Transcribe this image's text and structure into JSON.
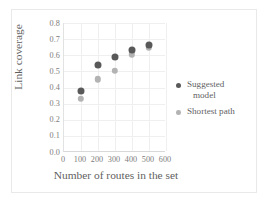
{
  "chart_data": {
    "type": "scatter",
    "title": "",
    "xlabel": "Number of routes in the set",
    "ylabel": "Link coverage",
    "xlim": [
      0,
      600
    ],
    "ylim": [
      0.0,
      0.8
    ],
    "grid": true,
    "legend_position": "right",
    "xticks": [
      "0",
      "100",
      "200",
      "300",
      "400",
      "500",
      "600"
    ],
    "yticks": [
      "0.0",
      "0.1",
      "0.2",
      "0.3",
      "0.4",
      "0.5",
      "0.6",
      "0.7",
      "0.8"
    ],
    "x": [
      100,
      200,
      300,
      400,
      500
    ],
    "series": [
      {
        "name": "Suggested model",
        "color": "#595959",
        "values": [
          0.38,
          0.54,
          0.59,
          0.63,
          0.665
        ]
      },
      {
        "name": "Shortest path",
        "color": "#b3b3b3",
        "values": [
          0.33,
          0.45,
          0.505,
          0.605,
          0.645
        ]
      }
    ]
  },
  "legend": {
    "entries": [
      {
        "label_line1": "Suggested",
        "label_line2": "model"
      },
      {
        "label_line1": "Shortest path",
        "label_line2": ""
      }
    ]
  }
}
